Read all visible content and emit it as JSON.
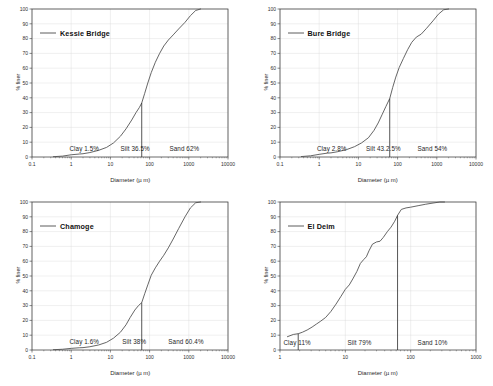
{
  "figure": {
    "panel_count": 4,
    "background": "#ffffff",
    "line_color": "#4a4a4a",
    "axis_color": "#3a3a3a",
    "grid_color": "#d9d9d9"
  },
  "common": {
    "xlabel": "Diameter (µ m)",
    "ylabel": "% finer",
    "ylim": [
      0,
      100
    ],
    "yticks": [
      0,
      10,
      20,
      30,
      40,
      50,
      60,
      70,
      80,
      90,
      100
    ],
    "legend_position": "upper-left"
  },
  "chart_data": [
    {
      "type": "line",
      "id": "kessie-bridge",
      "title": "",
      "legend": [
        "Kessie Bridge"
      ],
      "xlabel": "Diameter (µ m)",
      "ylabel": "% finer",
      "xscale": "log",
      "xlim": [
        0.1,
        10000
      ],
      "xticks": [
        0.1,
        1,
        10,
        100,
        1000,
        10000
      ],
      "xticklabels": [
        "0.1",
        "1",
        "10",
        "100",
        "1000",
        "10000"
      ],
      "ylim": [
        0,
        100
      ],
      "yticks": [
        0,
        10,
        20,
        30,
        40,
        50,
        60,
        70,
        80,
        90,
        100
      ],
      "grid": true,
      "series": [
        {
          "name": "Kessie Bridge",
          "x": [
            0.35,
            0.6,
            1.0,
            1.6,
            2.0,
            3.0,
            5.0,
            8.0,
            12.0,
            18.0,
            25.0,
            35.0,
            45.0,
            55.0,
            63.0,
            75.0,
            90.0,
            110.0,
            140.0,
            180.0,
            230.0,
            300.0,
            400.0,
            550.0,
            800.0,
            1100.0,
            1500.0,
            2000.0
          ],
          "y": [
            0.2,
            0.6,
            1.5,
            2.0,
            2.2,
            3.0,
            4.5,
            6.5,
            9.5,
            14.0,
            19.0,
            25.0,
            30.0,
            33.5,
            36.5,
            43.0,
            50.0,
            57.0,
            64.0,
            70.0,
            75.0,
            79.0,
            82.5,
            86.5,
            91.0,
            95.5,
            99.0,
            100.0
          ]
        }
      ],
      "divider": {
        "x": 63,
        "y_top": 36.5,
        "label": "clay-silt-sand boundary"
      },
      "annotations": [
        {
          "text": "Clay 1.5%",
          "x": 0.9,
          "y": 5.5
        },
        {
          "text": "Silt 36.5%",
          "x": 18,
          "y": 5.5
        },
        {
          "text": "Sand 62%",
          "x": 320,
          "y": 5.5
        }
      ],
      "fractions": {
        "clay": 1.5,
        "silt": 36.5,
        "sand": 62
      }
    },
    {
      "type": "line",
      "id": "bure-bridge",
      "title": "",
      "legend": [
        "Bure Bridge"
      ],
      "xlabel": "Diameter (µ m)",
      "ylabel": "% finer",
      "xscale": "log",
      "xlim": [
        0.1,
        10000
      ],
      "xticks": [
        0.1,
        1,
        10,
        100,
        1000,
        10000
      ],
      "xticklabels": [
        "0.1",
        "1",
        "10",
        "100",
        "1000",
        "10000"
      ],
      "ylim": [
        0,
        100
      ],
      "yticks": [
        0,
        10,
        20,
        30,
        40,
        50,
        60,
        70,
        80,
        90,
        100
      ],
      "grid": true,
      "series": [
        {
          "name": "Bure Bridge",
          "x": [
            0.35,
            0.6,
            1.0,
            1.6,
            2.0,
            3.0,
            5.0,
            8.0,
            12.0,
            18.0,
            25.0,
            32.0,
            40.0,
            50.0,
            63.0,
            75.0,
            90.0,
            110.0,
            140.0,
            180.0,
            230.0,
            300.0,
            400.0,
            550.0,
            800.0,
            1100.0,
            1500.0,
            2000.0
          ],
          "y": [
            0.3,
            0.8,
            1.8,
            2.6,
            2.8,
            3.6,
            5.0,
            7.0,
            9.5,
            13.0,
            18.0,
            23.0,
            28.5,
            34.0,
            39.5,
            47.0,
            54.0,
            60.5,
            66.5,
            72.5,
            77.5,
            81.0,
            83.0,
            87.0,
            92.0,
            96.5,
            99.5,
            100.0
          ]
        }
      ],
      "divider": {
        "x": 63,
        "y_top": 39.5,
        "label": "clay-silt-sand boundary"
      },
      "annotations": [
        {
          "text": "Clay 2.8%",
          "x": 0.9,
          "y": 5.5
        },
        {
          "text": "Silt 43.2.5%",
          "x": 16,
          "y": 5.5
        },
        {
          "text": "Sand 54%",
          "x": 330,
          "y": 5.5
        }
      ],
      "fractions": {
        "clay": 2.8,
        "silt": 43.2,
        "sand": 54
      }
    },
    {
      "type": "line",
      "id": "chamoge",
      "title": "",
      "legend": [
        "Chamoge"
      ],
      "xlabel": "Diameter (µ m)",
      "ylabel": "% finer",
      "xscale": "log",
      "xlim": [
        0.1,
        10000
      ],
      "xticks": [
        0.1,
        1,
        10,
        100,
        1000,
        10000
      ],
      "xticklabels": [
        "0.1",
        "1",
        "10",
        "100",
        "1000",
        "10000"
      ],
      "ylim": [
        0,
        100
      ],
      "yticks": [
        0,
        10,
        20,
        30,
        40,
        50,
        60,
        70,
        80,
        90,
        100
      ],
      "grid": true,
      "series": [
        {
          "name": "Chamoge",
          "x": [
            0.35,
            0.6,
            1.0,
            1.6,
            2.0,
            3.0,
            5.0,
            8.0,
            12.0,
            18.0,
            25.0,
            32.0,
            42.0,
            52.0,
            63.0,
            75.0,
            90.0,
            110.0,
            140.0,
            180.0,
            230.0,
            300.0,
            400.0,
            550.0,
            800.0,
            1100.0,
            1500.0,
            2000.0
          ],
          "y": [
            0.2,
            0.5,
            1.1,
            1.5,
            1.6,
            2.2,
            3.4,
            5.2,
            8.0,
            12.0,
            17.0,
            22.0,
            27.0,
            30.0,
            32.0,
            38.0,
            44.0,
            50.5,
            55.5,
            60.0,
            64.0,
            69.0,
            75.0,
            82.0,
            90.0,
            96.0,
            99.5,
            100.0
          ]
        }
      ],
      "divider": {
        "x": 63,
        "y_top": 32,
        "label": "clay-silt-sand boundary"
      },
      "annotations": [
        {
          "text": "Clay 1.6%",
          "x": 0.9,
          "y": 5.5
        },
        {
          "text": "Silt 38%",
          "x": 20,
          "y": 5.5
        },
        {
          "text": "Sand 60.4%",
          "x": 300,
          "y": 5.5
        }
      ],
      "fractions": {
        "clay": 1.6,
        "silt": 38,
        "sand": 60.4
      }
    },
    {
      "type": "line",
      "id": "el-deim",
      "title": "",
      "legend": [
        "El Deim"
      ],
      "xlabel": "Diameter (µ m)",
      "ylabel": "% finer",
      "xscale": "log",
      "xlim": [
        1,
        1000
      ],
      "xticks": [
        1,
        10,
        100,
        1000
      ],
      "xticklabels": [
        "1",
        "10",
        "100",
        "1000"
      ],
      "ylim": [
        0,
        100
      ],
      "yticks": [
        0,
        10,
        20,
        30,
        40,
        50,
        60,
        70,
        80,
        90,
        100
      ],
      "grid": true,
      "series": [
        {
          "name": "El Deim",
          "x": [
            1.3,
            1.6,
            1.9,
            2.2,
            2.6,
            3.1,
            3.6,
            4.2,
            5.0,
            6.0,
            7.2,
            8.5,
            10.0,
            11.5,
            13.0,
            15.0,
            17.0,
            19.0,
            21.0,
            23.0,
            26.0,
            30.0,
            34.0,
            38.0,
            44.0,
            50.0,
            57.0,
            63.0,
            72.0,
            85.0,
            100.0,
            130.0,
            170.0,
            220.0,
            280.0,
            330.0
          ],
          "y": [
            9.0,
            10.5,
            11.0,
            12.0,
            13.5,
            15.5,
            17.5,
            19.5,
            22.0,
            26.0,
            31.0,
            36.0,
            41.0,
            44.0,
            48.0,
            53.0,
            58.5,
            61.0,
            63.0,
            67.0,
            71.5,
            73.0,
            73.5,
            76.0,
            80.0,
            83.0,
            87.0,
            91.0,
            95.0,
            96.0,
            96.5,
            97.5,
            98.5,
            99.3,
            100.0,
            100.0
          ]
        }
      ],
      "divider": {
        "x": 63,
        "y_top": 91,
        "label": "silt-sand boundary"
      },
      "divider2": {
        "x": 1.9,
        "y_top": 11,
        "label": "clay-silt boundary"
      },
      "annotations": [
        {
          "text": "Clay 11%",
          "x": 1.15,
          "y": 4.5
        },
        {
          "text": "Silt 79%",
          "x": 11,
          "y": 4.5
        },
        {
          "text": "Sand 10%",
          "x": 130,
          "y": 4.5
        }
      ],
      "fractions": {
        "clay": 11,
        "silt": 79,
        "sand": 10
      }
    }
  ]
}
